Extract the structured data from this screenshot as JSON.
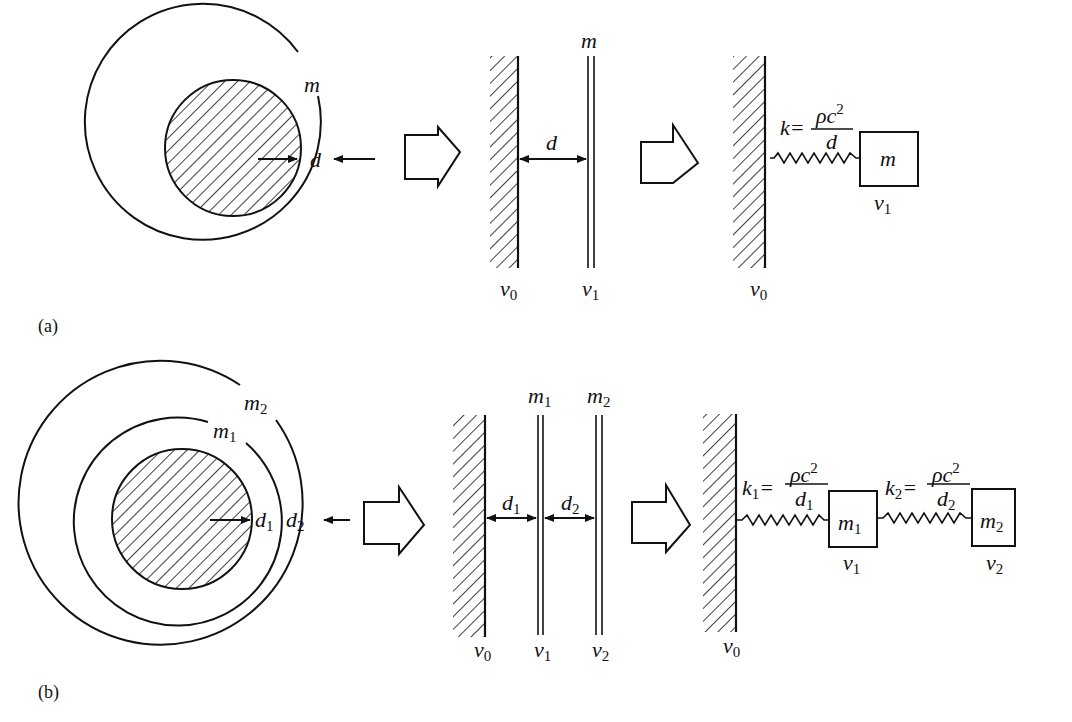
{
  "figure": {
    "panels": [
      {
        "id": "a",
        "label": "(a)",
        "sphere": {
          "shell_label": "m",
          "gap_label": "d"
        },
        "planar": {
          "plate_label": "m",
          "gap_label": "d",
          "wall_velocity": "v",
          "wall_velocity_sub": "0",
          "plate_velocity": "v",
          "plate_velocity_sub": "1"
        },
        "spring_mass": {
          "k_label": "k",
          "k_sub": "",
          "numerator": "ρc",
          "numerator_sup": "2",
          "denominator": "d",
          "denominator_sub": "",
          "mass_label": "m",
          "mass_sub": "",
          "mass_velocity": "v",
          "mass_velocity_sub": "1",
          "wall_velocity": "v",
          "wall_velocity_sub": "0"
        }
      },
      {
        "id": "b",
        "label": "(b)",
        "sphere": {
          "outer_shell_label": "m",
          "outer_shell_sub": "2",
          "inner_shell_label": "m",
          "inner_shell_sub": "1",
          "gap1_label": "d",
          "gap1_sub": "1",
          "gap2_label": "d",
          "gap2_sub": "2"
        },
        "planar": {
          "plate1_label": "m",
          "plate1_sub": "1",
          "plate2_label": "m",
          "plate2_sub": "2",
          "gap1_label": "d",
          "gap1_sub": "1",
          "gap2_label": "d",
          "gap2_sub": "2",
          "wall_velocity": "v",
          "wall_velocity_sub": "0",
          "plate1_velocity": "v",
          "plate1_velocity_sub": "1",
          "plate2_velocity": "v",
          "plate2_velocity_sub": "2"
        },
        "spring_mass": {
          "spring1": {
            "k_label": "k",
            "k_sub": "1",
            "numerator": "ρc",
            "numerator_sup": "2",
            "denominator": "d",
            "denominator_sub": "1"
          },
          "spring2": {
            "k_label": "k",
            "k_sub": "2",
            "numerator": "ρc",
            "numerator_sup": "2",
            "denominator": "d",
            "denominator_sub": "2"
          },
          "mass1_label": "m",
          "mass1_sub": "1",
          "mass2_label": "m",
          "mass2_sub": "2",
          "mass1_velocity": "v",
          "mass1_velocity_sub": "1",
          "mass2_velocity": "v",
          "mass2_velocity_sub": "2",
          "wall_velocity": "v",
          "wall_velocity_sub": "0"
        }
      }
    ],
    "equals_sign": "="
  }
}
